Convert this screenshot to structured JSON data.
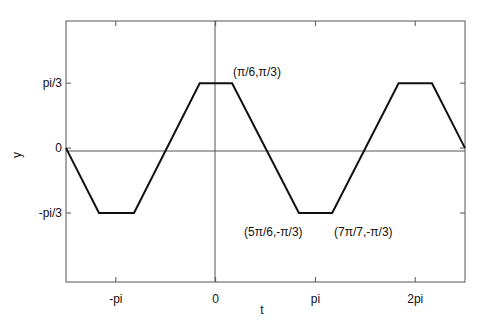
{
  "chart_data": {
    "type": "line",
    "title": "",
    "xlabel": "t",
    "ylabel": "y",
    "xlim": [
      -4.71,
      7.85
    ],
    "ylim": [
      -2.16,
      2.05
    ],
    "grid": false,
    "zero_lines": true,
    "x_ticks": [
      {
        "value": -3.1416,
        "label": "-pi"
      },
      {
        "value": 0,
        "label": "0"
      },
      {
        "value": 3.1416,
        "label": "pi"
      },
      {
        "value": 6.2832,
        "label": "2pi"
      }
    ],
    "y_ticks": [
      {
        "value": 1.0472,
        "label": "pi/3"
      },
      {
        "value": 0,
        "label": "0"
      },
      {
        "value": -1.0472,
        "label": "-pi/3"
      }
    ],
    "series": [
      {
        "name": "trapezoidal wave",
        "color": "#111111",
        "x": [
          -4.71,
          -3.67,
          -2.57,
          -0.5,
          0.52,
          2.62,
          3.67,
          5.76,
          6.81,
          7.85
        ],
        "y": [
          0,
          -1.0472,
          -1.0472,
          1.0472,
          1.0472,
          -1.0472,
          -1.0472,
          1.0472,
          1.0472,
          0
        ]
      }
    ],
    "annotations": [
      {
        "text": "(π/6,π/3)",
        "x": 0.52,
        "y": 1.0472
      },
      {
        "text": "(5π/6,-π/3)",
        "x": 2.62,
        "y": -1.0472
      },
      {
        "text": "(7π/7,-π/3)",
        "x": 3.67,
        "y": -1.0472
      }
    ]
  }
}
